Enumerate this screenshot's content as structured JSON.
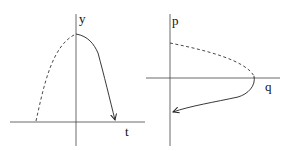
{
  "panels": [
    {
      "name": "time-plot",
      "x_axis_label": "t",
      "y_axis_label": "y",
      "curve": "downward parabola; dashed before peak, solid after peak with arrow"
    },
    {
      "name": "phase-plot",
      "x_axis_label": "q",
      "y_axis_label": "p",
      "curve": "leftward-opening parabola; dashed upper branch, solid lower branch with arrow"
    }
  ],
  "colors": {
    "line": "#222222",
    "background": "#ffffff"
  }
}
